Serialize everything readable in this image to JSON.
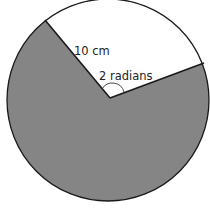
{
  "diagram": {
    "type": "circle-sector",
    "radius_label": "10 cm",
    "angle_label": "2 radians",
    "colors": {
      "shaded_region": "#858585",
      "unshaded_sector": "#ffffff",
      "outline": "#1a1a1a"
    }
  }
}
